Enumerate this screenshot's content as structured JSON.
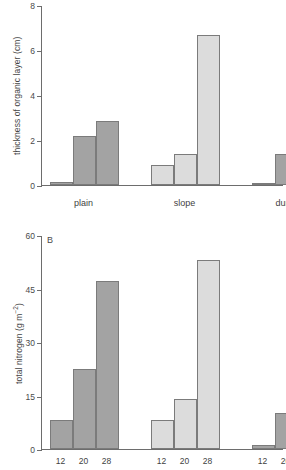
{
  "figure": {
    "width": 286,
    "height": 470,
    "background": "#ffffff",
    "bar_dark_color": "#a3a3a3",
    "bar_light_color": "#dcdcdc",
    "bar_edge_color": "#7b7b7b",
    "axis_color": "#6d6d6d"
  },
  "panel_a": {
    "letter": "",
    "ylabel_text": "thickness of organic layer (cm)",
    "ytick_labels": [
      "8",
      "6",
      "4",
      "2",
      "0"
    ],
    "group_labels": [
      "plain",
      "slope",
      "dune"
    ]
  },
  "panel_b": {
    "letter": "B",
    "ylabel_prefix": "total nitrogen (g m",
    "ylabel_sup": "−2",
    "ylabel_suffix": ")",
    "ylabel_text": "total nitrogen (g m⁻²)",
    "ytick_labels": [
      "60",
      "45",
      "30",
      "15",
      "0"
    ],
    "xtick_labels": [
      "12",
      "20",
      "28",
      "12",
      "20",
      "28",
      "12",
      "20",
      "28"
    ]
  },
  "chart_data": [
    {
      "type": "bar",
      "panel": "A",
      "title": "",
      "xlabel": "",
      "ylabel": "thickness of organic layer (cm)",
      "ylim": [
        0,
        8
      ],
      "yticks": [
        0,
        2,
        4,
        6,
        8
      ],
      "grid": false,
      "legend": "none",
      "groups": [
        "plain",
        "slope",
        "dune"
      ],
      "categories": [
        "12",
        "20",
        "28"
      ],
      "group_fill": [
        "dark",
        "light",
        "dark"
      ],
      "series": [
        {
          "name": "plain",
          "categories": [
            "12",
            "20",
            "28"
          ],
          "values": [
            0.15,
            2.2,
            2.85
          ],
          "fill": "#a3a3a3"
        },
        {
          "name": "slope",
          "categories": [
            "12",
            "20",
            "28"
          ],
          "values": [
            0.9,
            1.4,
            6.65
          ],
          "fill": "#dcdcdc"
        },
        {
          "name": "dune",
          "categories": [
            "12",
            "20",
            "28"
          ],
          "values": [
            0.0,
            1.4,
            1.85
          ],
          "fill": "#a3a3a3"
        }
      ]
    },
    {
      "type": "bar",
      "panel": "B",
      "title": "B",
      "xlabel": "",
      "ylabel": "total nitrogen (g m⁻²)",
      "ylim": [
        0,
        60
      ],
      "yticks": [
        0,
        15,
        30,
        45,
        60
      ],
      "grid": false,
      "legend": "none",
      "groups": [
        "plain",
        "slope",
        "dune"
      ],
      "categories": [
        "12",
        "20",
        "28"
      ],
      "group_fill": [
        "dark",
        "light",
        "dark"
      ],
      "series": [
        {
          "name": "plain",
          "categories": [
            "12",
            "20",
            "28"
          ],
          "values": [
            8.0,
            22.5,
            47.0
          ],
          "fill": "#a3a3a3"
        },
        {
          "name": "slope",
          "categories": [
            "12",
            "20",
            "28"
          ],
          "values": [
            8.2,
            14.0,
            53.0
          ],
          "fill": "#dcdcdc"
        },
        {
          "name": "dune",
          "categories": [
            "12",
            "20",
            "28"
          ],
          "values": [
            1.0,
            10.0,
            14.5
          ],
          "fill": "#a3a3a3"
        }
      ]
    }
  ]
}
